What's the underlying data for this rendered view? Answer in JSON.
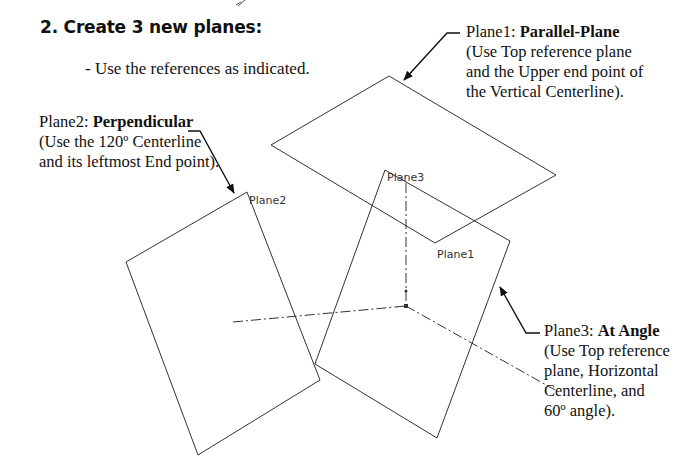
{
  "heading": "2. Create 3 new planes:",
  "instruction": "- Use the references as indicated.",
  "callouts": {
    "plane1": {
      "name": "Plane1: ",
      "type": "Parallel-Plane",
      "lines": [
        "(Use Top reference plane",
        "and the Upper end point of",
        "the Vertical Centerline)."
      ]
    },
    "plane2": {
      "name": "Plane2: ",
      "type": "Perpendicular",
      "lines": [
        "(Use the 120º Centerline",
        "and its leftmost End point)."
      ]
    },
    "plane3": {
      "name": "Plane3: ",
      "type": "At Angle",
      "lines": [
        "(Use Top reference",
        "plane, Horizontal",
        "Centerline, and",
        "60º angle)."
      ]
    }
  },
  "plane_labels": {
    "plane1": "Plane1",
    "plane2": "Plane2",
    "plane3": "Plane3"
  },
  "colors": {
    "line": "#333333",
    "arrow": "#111111",
    "background": "#ffffff"
  }
}
